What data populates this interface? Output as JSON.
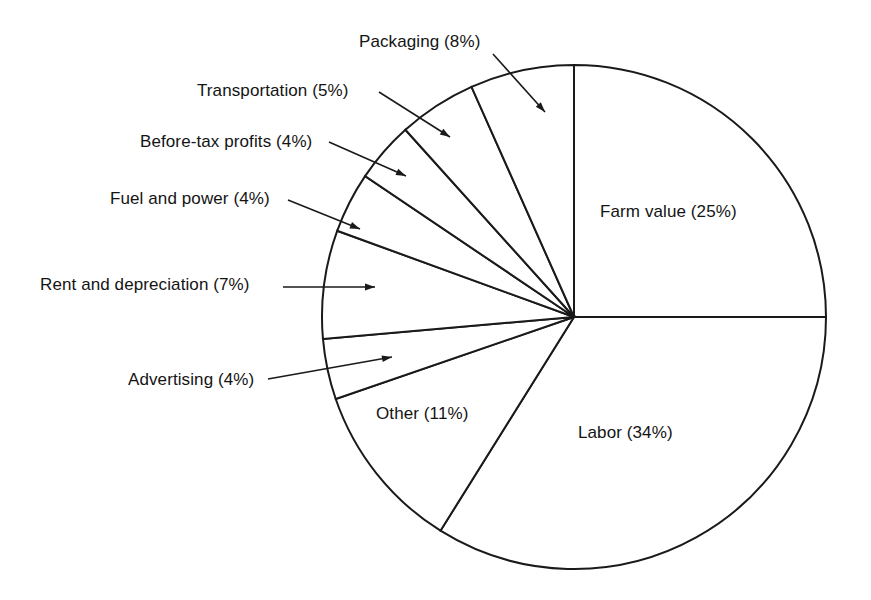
{
  "chart_data": {
    "type": "pie",
    "title": "",
    "subtitle": "",
    "xlabel": "",
    "ylabel": "",
    "legend_position": "none",
    "grid": false,
    "units": "percent",
    "total": 102,
    "start_angle_deg": 0,
    "direction": "clockwise",
    "categories": [
      "Farm value",
      "Labor",
      "Other",
      "Advertising",
      "Rent and depreciation",
      "Fuel and power",
      "Before-tax profits",
      "Transportation",
      "Packaging"
    ],
    "values": [
      25,
      34,
      11,
      4,
      7,
      4,
      4,
      5,
      8
    ],
    "slices": [
      {
        "name": "Farm value",
        "value": 25,
        "label": "Farm value (25%)",
        "percent_text": "25%",
        "start_deg": 0,
        "end_deg": 90,
        "label_placement": "inside",
        "label_x": 600,
        "label_y": 203,
        "leader": false
      },
      {
        "name": "Labor",
        "value": 34,
        "label": "Labor (34%)",
        "percent_text": "34%",
        "start_deg": 90,
        "end_deg": 212,
        "label_placement": "inside",
        "label_x": 578,
        "label_y": 424,
        "leader": false
      },
      {
        "name": "Other",
        "value": 11,
        "label": "Other (11%)",
        "percent_text": "11%",
        "start_deg": 212,
        "end_deg": 251,
        "label_placement": "inside",
        "label_x": 376,
        "label_y": 405,
        "leader": false
      },
      {
        "name": "Advertising",
        "value": 4,
        "label": "Advertising (4%)",
        "percent_text": "4%",
        "start_deg": 251,
        "end_deg": 265,
        "label_placement": "outside-left",
        "label_x": 128,
        "label_y": 371,
        "leader": true,
        "leader_x1": 268,
        "leader_y1": 379,
        "leader_x2": 392,
        "leader_y2": 357
      },
      {
        "name": "Rent and depreciation",
        "value": 7,
        "label": "Rent and depreciation (7%)",
        "percent_text": "7%",
        "start_deg": 265,
        "end_deg": 290,
        "label_placement": "outside-left",
        "label_x": 40,
        "label_y": 276,
        "leader": true,
        "leader_x1": 283,
        "leader_y1": 287,
        "leader_x2": 375,
        "leader_y2": 287
      },
      {
        "name": "Fuel and power",
        "value": 4,
        "label": "Fuel and power (4%)",
        "percent_text": "4%",
        "start_deg": 290,
        "end_deg": 304,
        "label_placement": "outside-left",
        "label_x": 110,
        "label_y": 190,
        "leader": true,
        "leader_x1": 288,
        "leader_y1": 200,
        "leader_x2": 360,
        "leader_y2": 229
      },
      {
        "name": "Before-tax profits",
        "value": 4,
        "label": "Before-tax profits (4%)",
        "percent_text": "4%",
        "start_deg": 304,
        "end_deg": 318,
        "label_placement": "outside-left",
        "label_x": 140,
        "label_y": 133,
        "leader": true,
        "leader_x1": 329,
        "leader_y1": 142,
        "leader_x2": 406,
        "leader_y2": 176
      },
      {
        "name": "Transportation",
        "value": 5,
        "label": "Transportation (5%)",
        "percent_text": "5%",
        "start_deg": 318,
        "end_deg": 336,
        "label_placement": "outside-left",
        "label_x": 197,
        "label_y": 82,
        "leader": true,
        "leader_x1": 379,
        "leader_y1": 92,
        "leader_x2": 450,
        "leader_y2": 137
      },
      {
        "name": "Packaging",
        "value": 8,
        "label": "Packaging (8%)",
        "percent_text": "8%",
        "start_deg": 336,
        "end_deg": 360,
        "label_placement": "outside-top",
        "label_x": 359,
        "label_y": 33,
        "leader": true,
        "leader_x1": 493,
        "leader_y1": 54,
        "leader_x2": 545,
        "leader_y2": 112
      }
    ],
    "geometry": {
      "center_x": 574,
      "center_y": 317,
      "radius": 252,
      "stroke_color": "#1a1a1a",
      "fill_color": "#ffffff",
      "stroke_width": 2
    }
  }
}
